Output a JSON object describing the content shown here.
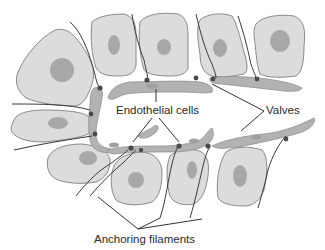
{
  "diagram": {
    "type": "lymphatic capillary schematic",
    "labels": {
      "endothelial_cells": "Endothelial cells",
      "valves": "Valves",
      "anchoring_filaments": "Anchoring filaments"
    },
    "colors": {
      "tissue_cell_fill": "#dcdcdc",
      "tissue_cell_stroke": "#8a8a8a",
      "nucleus": "#a8a8a8",
      "endothelium": "#b2b2b2",
      "lines": "#333333"
    }
  }
}
